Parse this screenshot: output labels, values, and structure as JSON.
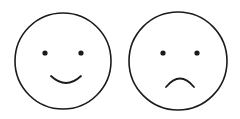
{
  "faces": [
    {
      "label": "happy",
      "expression": "smile"
    },
    {
      "label": "sad",
      "expression": "frown"
    }
  ],
  "colors": {
    "stroke": "#1a1a1a",
    "background": "#ffffff"
  }
}
